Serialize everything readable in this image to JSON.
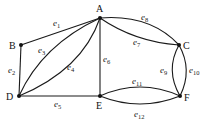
{
  "diagram": {
    "type": "graph",
    "vertices": [
      {
        "id": "A",
        "label": "A",
        "x": 100,
        "y": 18
      },
      {
        "id": "B",
        "label": "B",
        "x": 21,
        "y": 45
      },
      {
        "id": "C",
        "label": "C",
        "x": 179,
        "y": 45
      },
      {
        "id": "D",
        "label": "D",
        "x": 19,
        "y": 96
      },
      {
        "id": "E",
        "label": "E",
        "x": 100,
        "y": 96
      },
      {
        "id": "F",
        "label": "F",
        "x": 180,
        "y": 96
      }
    ],
    "edges": [
      {
        "id": "e1",
        "label": "e",
        "sub": "1",
        "from": "A",
        "to": "B"
      },
      {
        "id": "e2",
        "label": "e",
        "sub": "2",
        "from": "B",
        "to": "D"
      },
      {
        "id": "e3",
        "label": "e",
        "sub": "3",
        "from": "A",
        "to": "D"
      },
      {
        "id": "e4",
        "label": "e",
        "sub": "4",
        "from": "A",
        "to": "D"
      },
      {
        "id": "e5",
        "label": "e",
        "sub": "5",
        "from": "D",
        "to": "E"
      },
      {
        "id": "e6",
        "label": "e",
        "sub": "6",
        "from": "A",
        "to": "E"
      },
      {
        "id": "e7",
        "label": "e",
        "sub": "7",
        "from": "A",
        "to": "C"
      },
      {
        "id": "e8",
        "label": "e",
        "sub": "8",
        "from": "A",
        "to": "C"
      },
      {
        "id": "e9",
        "label": "e",
        "sub": "9",
        "from": "C",
        "to": "F"
      },
      {
        "id": "e10",
        "label": "e",
        "sub": "10",
        "from": "C",
        "to": "F"
      },
      {
        "id": "e11",
        "label": "e",
        "sub": "11",
        "from": "E",
        "to": "F"
      },
      {
        "id": "e12",
        "label": "e",
        "sub": "12",
        "from": "E",
        "to": "F"
      }
    ]
  }
}
